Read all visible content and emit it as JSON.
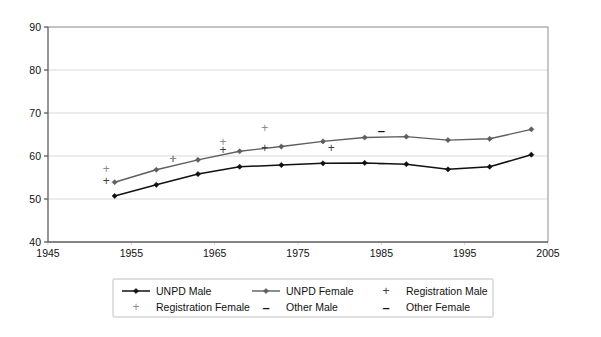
{
  "chart_data": {
    "type": "line",
    "title": "",
    "subtitle": "",
    "xlabel": "",
    "ylabel": "",
    "xlim": [
      1945,
      2005
    ],
    "ylim": [
      40,
      90
    ],
    "grid": true,
    "legend_position": "bottom",
    "y_ticks": [
      40,
      50,
      60,
      70,
      80,
      90
    ],
    "y_tick_labels": [
      "40",
      "50",
      "60",
      "70",
      "80",
      "90"
    ],
    "x_ticks": [
      1945,
      1955,
      1965,
      1975,
      1985,
      1995,
      2005
    ],
    "x_tick_labels": [
      "1945",
      "1955",
      "1965",
      "1975",
      "1985",
      "1995",
      "2005"
    ],
    "series": [
      {
        "name": "UNPD Male",
        "style": "line-marker",
        "color": "#111111",
        "marker": "diamond",
        "x": [
          1953,
          1958,
          1963,
          1968,
          1973,
          1978,
          1983,
          1988,
          1993,
          1998,
          2003
        ],
        "values": [
          50.7,
          53.3,
          55.8,
          57.5,
          57.9,
          58.3,
          58.4,
          58.1,
          56.9,
          57.5,
          60.3
        ]
      },
      {
        "name": "UNPD Female",
        "style": "line-marker",
        "color": "#5e5e5e",
        "marker": "diamond",
        "x": [
          1953,
          1958,
          1963,
          1968,
          1973,
          1978,
          1983,
          1988,
          1993,
          1998,
          2003
        ],
        "values": [
          53.9,
          56.8,
          59.1,
          61.1,
          62.2,
          63.4,
          64.3,
          64.5,
          63.7,
          64.0,
          66.2
        ]
      },
      {
        "name": "Registration Male",
        "style": "marker-only",
        "color": "#3d3d3d",
        "marker": "plus",
        "x": [
          1952,
          1960,
          1966,
          1971,
          1979
        ],
        "values": [
          54.2,
          59.2,
          61.5,
          61.8,
          61.9
        ]
      },
      {
        "name": "Registration Female",
        "style": "marker-only",
        "color": "#8c8c8c",
        "marker": "plus",
        "x": [
          1952,
          1960,
          1966,
          1971
        ],
        "values": [
          57.0,
          59.2,
          63.3,
          66.5
        ]
      },
      {
        "name": "Other Male",
        "style": "marker-only",
        "color": "#111111",
        "marker": "dash",
        "x": [
          1985
        ],
        "values": [
          58.4
        ]
      },
      {
        "name": "Other Female",
        "style": "marker-only",
        "color": "#111111",
        "marker": "dash",
        "x": [
          1985
        ],
        "values": [
          65.9
        ]
      }
    ],
    "legend_entries": [
      {
        "label": "UNPD Male",
        "marker": "line-diamond",
        "color": "#111111"
      },
      {
        "label": "UNPD Female",
        "marker": "line-diamond",
        "color": "#5e5e5e"
      },
      {
        "label": "Registration Male",
        "marker": "plus",
        "color": "#3d3d3d"
      },
      {
        "label": "Registration Female",
        "marker": "plus",
        "color": "#8c8c8c"
      },
      {
        "label": "Other Male",
        "marker": "dash",
        "color": "#111111"
      },
      {
        "label": "Other Female",
        "marker": "dash",
        "color": "#111111"
      }
    ]
  },
  "colors": {
    "background": "#ffffff",
    "grid": "#c8c8c8",
    "axis": "#5c5c5c",
    "male": "#111111",
    "female": "#5e5e5e",
    "registration_male": "#3d3d3d",
    "registration_female": "#8c8c8c"
  }
}
